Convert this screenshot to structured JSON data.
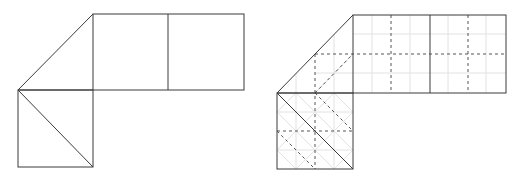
{
  "colors": {
    "background": "#ffffff",
    "solid_line": "#3a3a3a",
    "dashed_line": "#555555",
    "faint_grid": "#e2e2e2"
  },
  "figures": [
    {
      "name": "net-plain",
      "vertex": [
        18,
        90
      ],
      "top_left": [
        93,
        14
      ],
      "unit": 75,
      "description": "Net of two squares on top, one square below-left with diagonal, and triangle flap"
    },
    {
      "name": "net-with-folds",
      "vertex": [
        277,
        93
      ],
      "top_left": [
        353,
        15
      ],
      "unit": 76,
      "description": "Same net subdivided with dashed fold lines at half intervals and faint quarter grid"
    }
  ]
}
